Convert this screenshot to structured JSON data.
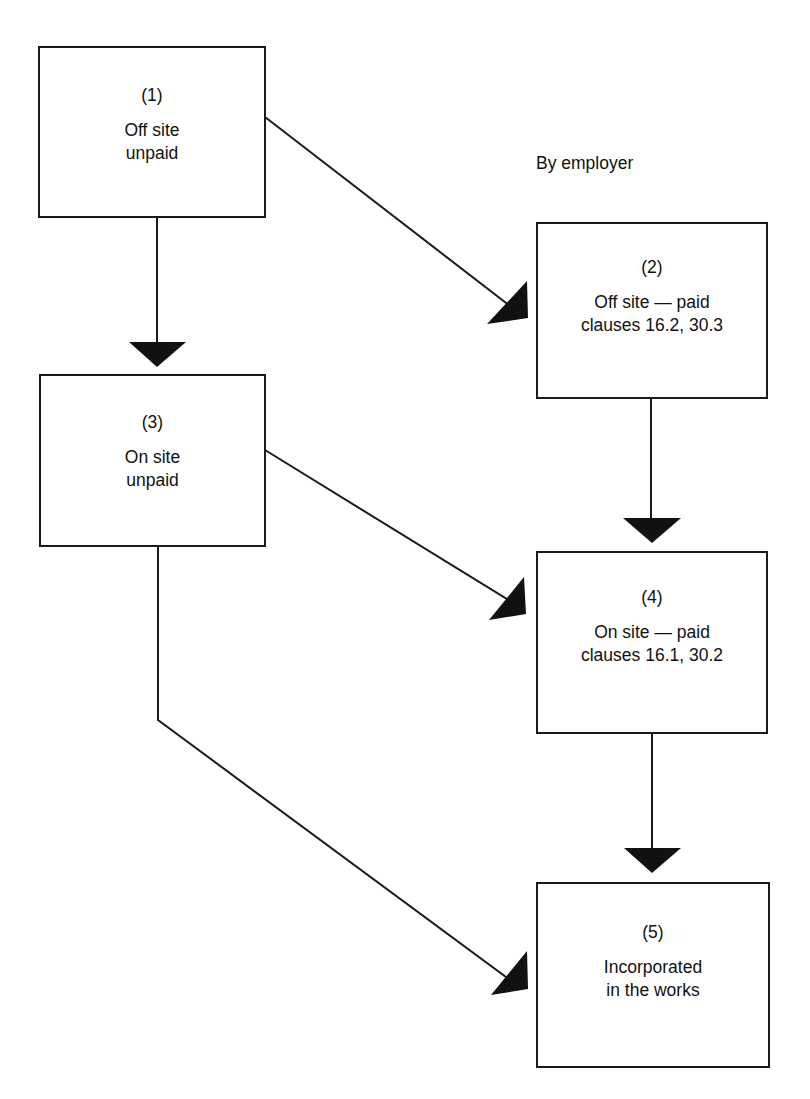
{
  "diagram": {
    "annotation": "By employer",
    "nodes": [
      {
        "id": 1,
        "number": "(1)",
        "lines": [
          "Off site",
          "unpaid"
        ]
      },
      {
        "id": 2,
        "number": "(2)",
        "lines": [
          "Off site — paid",
          "clauses 16.2, 30.3"
        ]
      },
      {
        "id": 3,
        "number": "(3)",
        "lines": [
          "On site",
          "unpaid"
        ]
      },
      {
        "id": 4,
        "number": "(4)",
        "lines": [
          "On site — paid",
          "clauses 16.1, 30.2"
        ]
      },
      {
        "id": 5,
        "number": "(5)",
        "lines": [
          "Incorporated",
          "in the works"
        ]
      }
    ],
    "edges": [
      {
        "from": 1,
        "to": 2
      },
      {
        "from": 1,
        "to": 3
      },
      {
        "from": 2,
        "to": 4
      },
      {
        "from": 3,
        "to": 4
      },
      {
        "from": 3,
        "to": 5
      },
      {
        "from": 4,
        "to": 5
      }
    ],
    "colors": {
      "line": "#1a1a1a",
      "background": "#ffffff"
    }
  }
}
